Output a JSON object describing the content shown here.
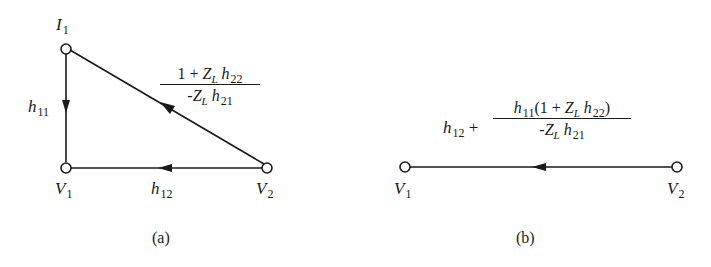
{
  "figure_a": {
    "caption": "(a)",
    "nodes": {
      "I1": {
        "main": "I",
        "sub": "1"
      },
      "V1": {
        "main": "V",
        "sub": "1"
      },
      "V2": {
        "main": "V",
        "sub": "2"
      }
    },
    "branches": {
      "h11": {
        "main": "h",
        "sub": "11"
      },
      "h12": {
        "main": "h",
        "sub": "12"
      },
      "diag": {
        "num_1": "1 + ",
        "num_Z": "Z",
        "num_Zsub": "L",
        "num_h": " h",
        "num_hsub": "22",
        "den_minus": "-",
        "den_Z": "Z",
        "den_Zsub": "L",
        "den_h": " h",
        "den_hsub": "21"
      }
    }
  },
  "figure_b": {
    "caption": "(b)",
    "nodes": {
      "V1": {
        "main": "V",
        "sub": "1"
      },
      "V2": {
        "main": "V",
        "sub": "2"
      }
    },
    "branch": {
      "lead_h": "h",
      "lead_sub": "12",
      "plus": " + ",
      "num_h": "h",
      "num_hsub": "11",
      "num_open": "(1 + ",
      "num_Z": "Z",
      "num_Zsub": "L",
      "num_h2": " h",
      "num_h2sub": "22",
      "num_close": ")",
      "den_minus": "-",
      "den_Z": "Z",
      "den_Zsub": "L",
      "den_h": " h",
      "den_hsub": "21"
    }
  }
}
